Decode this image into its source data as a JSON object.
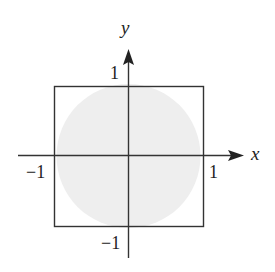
{
  "diagram": {
    "type": "coordinate-plane",
    "axes": {
      "x": {
        "label": "x"
      },
      "y": {
        "label": "y"
      }
    },
    "tick_labels": {
      "x_neg": "−1",
      "x_pos": "1",
      "y_pos": "1",
      "y_neg": "−1"
    },
    "shapes": {
      "square": {
        "x_range": [
          -1,
          1
        ],
        "y_range": [
          -1,
          1
        ],
        "stroke": "#333333"
      },
      "disk": {
        "center": [
          0,
          0
        ],
        "radius": 1,
        "fill": "#eeeeee"
      }
    },
    "colors": {
      "line": "#333333",
      "disk_fill": "#eeeeee",
      "background": "#ffffff"
    }
  }
}
